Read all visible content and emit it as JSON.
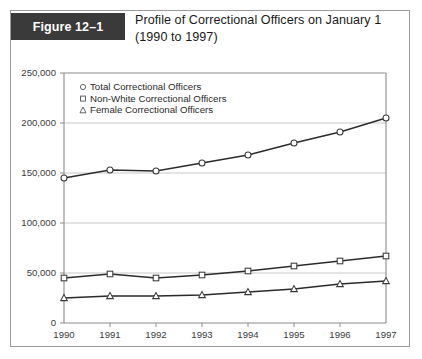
{
  "figure": {
    "tag": "Figure 12–1",
    "title_line1": "Profile of Correctional Officers on January 1",
    "title_line2": "(1990 to 1997)"
  },
  "chart_data": {
    "type": "line",
    "title": "Profile of Correctional Officers on January 1 (1990 to 1997)",
    "xlabel": "",
    "ylabel": "",
    "categories": [
      "1990",
      "1991",
      "1992",
      "1993",
      "1994",
      "1995",
      "1996",
      "1997"
    ],
    "x": [
      1990,
      1991,
      1992,
      1993,
      1994,
      1995,
      1996,
      1997
    ],
    "ylim": [
      0,
      250000
    ],
    "ytick_values": [
      0,
      50000,
      100000,
      150000,
      200000,
      250000
    ],
    "ytick_labels": [
      "0",
      "50,000",
      "100,000",
      "150,000",
      "200,000",
      "250,000"
    ],
    "grid": true,
    "legend_position": "top-left-inside",
    "series": [
      {
        "name": "Total Correctional Officers",
        "marker": "circle",
        "values": [
          145000,
          153000,
          152000,
          160000,
          168000,
          180000,
          191000,
          205000
        ]
      },
      {
        "name": "Non-White Correctional Officers",
        "marker": "square",
        "values": [
          45000,
          49000,
          45000,
          48000,
          52000,
          57000,
          62000,
          67000
        ]
      },
      {
        "name": "Female Correctional Officers",
        "marker": "triangle",
        "values": [
          25000,
          27000,
          27000,
          28000,
          31000,
          34000,
          39000,
          42000
        ]
      }
    ]
  },
  "colors": {
    "tag_background": "#3a3a3a",
    "tag_text": "#ffffff",
    "border": "#9a9a9a",
    "gridline": "#c8c8c8",
    "axis": "#8c8c8c",
    "line": "#2b2b2b",
    "marker_fill": "#ffffff"
  }
}
